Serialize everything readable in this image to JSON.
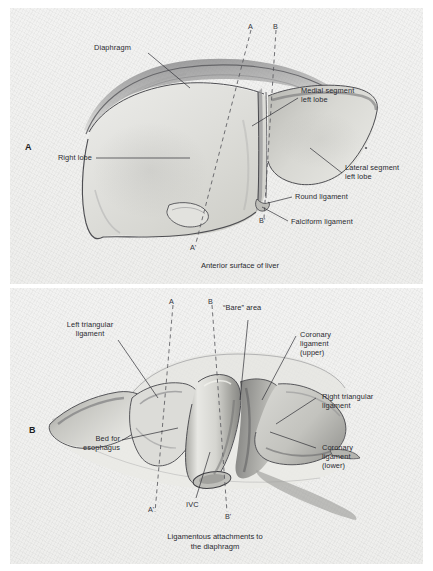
{
  "figure": {
    "kind": "anatomical-illustration",
    "background_color": "#efefed",
    "ink_color": "#2a2a30"
  },
  "panel_a": {
    "letter": "A",
    "caption": "Anterior surface of liver",
    "labels": [
      {
        "id": "diaphragm",
        "text": "Diaphragm"
      },
      {
        "id": "right-lobe",
        "text": "Right lobe"
      },
      {
        "id": "medial-segment",
        "text": "Medial segment\nleft lobe"
      },
      {
        "id": "lateral-segment",
        "text": "Lateral segment\nleft lobe"
      },
      {
        "id": "round-ligament",
        "text": "Round ligament"
      },
      {
        "id": "falciform",
        "text": "Falciform ligament"
      }
    ],
    "section_markers": [
      {
        "id": "a-top",
        "text": "A"
      },
      {
        "id": "b-top",
        "text": "B"
      },
      {
        "id": "a-bottom",
        "text": "A'"
      },
      {
        "id": "b-bottom",
        "text": "B'"
      }
    ]
  },
  "panel_b": {
    "letter": "B",
    "caption": "Ligamentous attachments to\nthe diaphragm",
    "labels": [
      {
        "id": "left-triangular",
        "text": "Left triangular\nligament"
      },
      {
        "id": "bare-area",
        "text": "“Bare” area"
      },
      {
        "id": "coronary-upper",
        "text": "Coronary\nligament\n(upper)"
      },
      {
        "id": "right-triangular",
        "text": "Right triangular\nligament"
      },
      {
        "id": "coronary-lower",
        "text": "Coronary\nligament\n(lower)"
      },
      {
        "id": "bed-esophagus",
        "text": "Bed for\nesophagus"
      },
      {
        "id": "ivc",
        "text": "IVC"
      }
    ],
    "section_markers": [
      {
        "id": "a-top",
        "text": "A"
      },
      {
        "id": "b-top",
        "text": "B"
      },
      {
        "id": "a-bottom",
        "text": "A'"
      },
      {
        "id": "b-bottom",
        "text": "B'"
      }
    ]
  }
}
